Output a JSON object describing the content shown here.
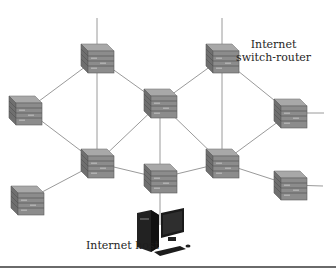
{
  "labels": {
    "router_line1": "Internet",
    "router_line2": "switch-router",
    "host": "Internet host"
  },
  "colors": {
    "background": "#ffffff",
    "link": "#9a9a9a",
    "router_top": "#a8a8a8",
    "router_side": "#6f6f6f",
    "router_front": "#8c8c8c",
    "router_stripe": "#5c5c5c",
    "host": "#1c1c1c",
    "text": "#1e1e1e"
  },
  "nodes": [
    {
      "id": "A",
      "type": "switch-router",
      "x": 97,
      "y": 58
    },
    {
      "id": "B",
      "type": "switch-router",
      "x": 222,
      "y": 58
    },
    {
      "id": "C",
      "type": "switch-router",
      "x": 27,
      "y": 110
    },
    {
      "id": "D",
      "type": "switch-router",
      "x": 160,
      "y": 103
    },
    {
      "id": "E",
      "type": "switch-router",
      "x": 290,
      "y": 113
    },
    {
      "id": "F",
      "type": "switch-router",
      "x": 97,
      "y": 163
    },
    {
      "id": "G",
      "type": "switch-router",
      "x": 222,
      "y": 163
    },
    {
      "id": "H",
      "type": "switch-router",
      "x": 160,
      "y": 178
    },
    {
      "id": "I",
      "type": "switch-router",
      "x": 27,
      "y": 200
    },
    {
      "id": "J",
      "type": "switch-router",
      "x": 290,
      "y": 185
    },
    {
      "id": "host",
      "type": "internet-host",
      "x": 160,
      "y": 232
    }
  ],
  "links": [
    [
      "A",
      "D"
    ],
    [
      "B",
      "D"
    ],
    [
      "A",
      "C"
    ],
    [
      "A",
      "F"
    ],
    [
      "B",
      "E"
    ],
    [
      "B",
      "G"
    ],
    [
      "C",
      "F"
    ],
    [
      "D",
      "F"
    ],
    [
      "D",
      "G"
    ],
    [
      "D",
      "H"
    ],
    [
      "E",
      "G"
    ],
    [
      "F",
      "I"
    ],
    [
      "F",
      "H"
    ],
    [
      "G",
      "H"
    ],
    [
      "G",
      "J"
    ],
    [
      "H",
      "host"
    ]
  ],
  "stub_links": [
    {
      "from": "A",
      "to": [
        97,
        18
      ]
    },
    {
      "from": "B",
      "to": [
        222,
        18
      ]
    },
    {
      "from": "C",
      "to": [
        12,
        110
      ]
    },
    {
      "from": "E",
      "to": [
        324,
        113
      ]
    },
    {
      "from": "I",
      "to": [
        14,
        196
      ]
    },
    {
      "from": "J",
      "to": [
        323,
        186
      ]
    }
  ]
}
